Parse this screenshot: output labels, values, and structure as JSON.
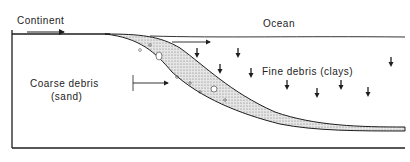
{
  "diagram": {
    "labels": {
      "continent": "Continent",
      "ocean": "Ocean",
      "coarse_line1": "Coarse debris",
      "coarse_line2": "(sand)",
      "fine": "Fine debris (clays)"
    },
    "colors": {
      "ink": "#1e1e1e",
      "sediment_fill": "#d8d8d8",
      "background": "#ffffff"
    },
    "down_arrows": [
      {
        "x": 197,
        "y": 48
      },
      {
        "x": 238,
        "y": 48
      },
      {
        "x": 220,
        "y": 64
      },
      {
        "x": 251,
        "y": 68
      },
      {
        "x": 287,
        "y": 80
      },
      {
        "x": 317,
        "y": 88
      },
      {
        "x": 341,
        "y": 80
      },
      {
        "x": 368,
        "y": 87
      },
      {
        "x": 391,
        "y": 57
      }
    ]
  }
}
